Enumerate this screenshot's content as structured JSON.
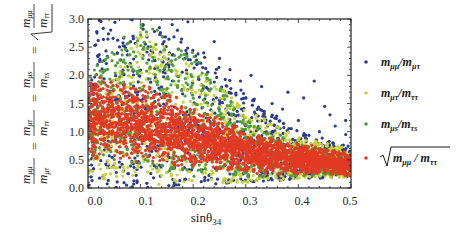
{
  "chart_data": {
    "type": "scatter",
    "title": "",
    "xlabel": "sinθ34",
    "xlabel_parts": {
      "base": "sinθ",
      "sub": "34"
    },
    "ylabel": "m_μμ/m_μτ = m_μτ/m_ττ = m_μs/m_τs = √(m_μμ/m_ττ)",
    "xlim": [
      0.0,
      0.5
    ],
    "ylim": [
      0.0,
      3.0
    ],
    "xticks": [
      "0.0",
      "0.1",
      "0.2",
      "0.3",
      "0.4",
      "0.5"
    ],
    "yticks": [
      "0.0",
      "0.5",
      "1.0",
      "1.5",
      "2.0",
      "2.5",
      "3.0"
    ],
    "grid": false,
    "legend_position": "right",
    "series": [
      {
        "name": "m_μμ/m_μτ",
        "label_main": "m",
        "color": "#2b3a8f",
        "count": 900,
        "envelope": {
          "x": [
            0.0,
            0.1,
            0.2,
            0.3,
            0.4,
            0.5
          ],
          "y_low": [
            0.0,
            0.0,
            0.05,
            0.1,
            0.15,
            0.2
          ],
          "y_high": [
            3.0,
            3.0,
            2.6,
            1.7,
            1.0,
            0.75
          ]
        },
        "outliers": [
          [
            0.16,
            2.9
          ],
          [
            0.17,
            2.8
          ],
          [
            0.19,
            2.95
          ],
          [
            0.25,
            2.3
          ],
          [
            0.27,
            2.1
          ],
          [
            0.29,
            1.9
          ],
          [
            0.31,
            2.0
          ],
          [
            0.33,
            1.8
          ],
          [
            0.37,
            1.4
          ],
          [
            0.4,
            1.2
          ],
          [
            0.41,
            1.6
          ],
          [
            0.43,
            1.9
          ],
          [
            0.44,
            1.0
          ],
          [
            0.46,
            1.3
          ],
          [
            0.47,
            1.1
          ],
          [
            0.49,
            1.2
          ],
          [
            0.49,
            0.95
          ],
          [
            0.35,
            1.5
          ],
          [
            0.38,
            1.7
          ],
          [
            0.45,
            1.45
          ],
          [
            0.3,
            1.6
          ],
          [
            0.22,
            2.4
          ],
          [
            0.24,
            2.6
          ]
        ]
      },
      {
        "name": "m_μτ/m_ττ",
        "color": "#c9d23a",
        "count": 900,
        "envelope": {
          "x": [
            0.0,
            0.1,
            0.2,
            0.3,
            0.4,
            0.5
          ],
          "y_low": [
            0.2,
            0.05,
            0.05,
            0.1,
            0.15,
            0.2
          ],
          "y_high": [
            1.2,
            2.8,
            2.2,
            1.4,
            0.9,
            0.7
          ]
        },
        "outliers": []
      },
      {
        "name": "m_μs/m_τs",
        "color": "#4f9e3a",
        "count": 800,
        "envelope": {
          "x": [
            0.0,
            0.1,
            0.2,
            0.3,
            0.4,
            0.5
          ],
          "y_low": [
            0.6,
            0.4,
            0.2,
            0.2,
            0.2,
            0.25
          ],
          "y_high": [
            2.0,
            3.0,
            2.4,
            1.2,
            0.8,
            0.6
          ]
        },
        "outliers": []
      },
      {
        "name": "√(m_μμ/m_ττ)",
        "color": "#e23a24",
        "count": 2600,
        "envelope": {
          "x": [
            0.0,
            0.1,
            0.2,
            0.3,
            0.4,
            0.5
          ],
          "y_low": [
            0.5,
            0.45,
            0.35,
            0.25,
            0.22,
            0.2
          ],
          "y_high": [
            2.0,
            1.9,
            1.5,
            1.05,
            0.8,
            0.65
          ]
        },
        "outliers": []
      }
    ]
  },
  "axes": {
    "x_title": {
      "base": "sinθ",
      "sub": "34"
    },
    "y_title_terms": [
      {
        "num": "m",
        "num_sub": "μμ",
        "den": "m",
        "den_sub": "μτ"
      },
      {
        "num": "m",
        "num_sub": "μτ",
        "den": "m",
        "den_sub": "ττ"
      },
      {
        "num": "m",
        "num_sub": "μs",
        "den": "m",
        "den_sub": "τs"
      },
      {
        "num": "m",
        "num_sub": "μμ",
        "den": "m",
        "den_sub": "ττ",
        "sqrt": true
      }
    ],
    "equals": "="
  },
  "legend": {
    "items": [
      {
        "main1": "m",
        "sub1": "μμ",
        "slash": "/",
        "main2": "m",
        "sub2": "μτ",
        "sqrt": false
      },
      {
        "main1": "m",
        "sub1": "μτ",
        "slash": "/",
        "main2": "m",
        "sub2": "ττ",
        "sqrt": false
      },
      {
        "main1": "m",
        "sub1": "μs",
        "slash": "/",
        "main2": "m",
        "sub2": "τs",
        "sqrt": false
      },
      {
        "main1": "m",
        "sub1": "μμ",
        "slash": " / ",
        "main2": "m",
        "sub2": "ττ",
        "sqrt": true
      }
    ]
  }
}
